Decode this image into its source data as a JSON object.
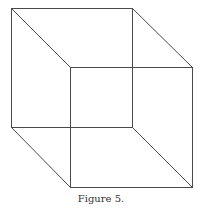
{
  "figure": {
    "caption": "Figure 5.",
    "type": "necker-cube",
    "line_color": "#4a4a4a",
    "vertices": {
      "back_top_left": [
        11,
        8
      ],
      "back_top_right": [
        132,
        8
      ],
      "back_bottom_left": [
        11,
        127
      ],
      "back_bottom_right": [
        132,
        127
      ],
      "front_top_left": [
        70,
        67
      ],
      "front_top_right": [
        192,
        67
      ],
      "front_bottom_left": [
        70,
        187
      ],
      "front_bottom_right": [
        192,
        187
      ]
    },
    "edges": [
      [
        "back_top_left",
        "back_top_right"
      ],
      [
        "back_top_right",
        "back_bottom_right"
      ],
      [
        "back_bottom_right",
        "back_bottom_left"
      ],
      [
        "back_bottom_left",
        "back_top_left"
      ],
      [
        "front_top_left",
        "front_top_right"
      ],
      [
        "front_top_right",
        "front_bottom_right"
      ],
      [
        "front_bottom_right",
        "front_bottom_left"
      ],
      [
        "front_bottom_left",
        "front_top_left"
      ],
      [
        "back_top_left",
        "front_top_left"
      ],
      [
        "back_top_right",
        "front_top_right"
      ],
      [
        "back_bottom_left",
        "front_bottom_left"
      ],
      [
        "back_bottom_right",
        "front_bottom_right"
      ]
    ]
  }
}
